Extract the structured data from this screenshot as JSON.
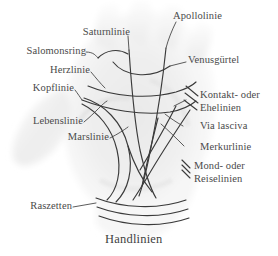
{
  "figure": {
    "title": "Handlinien",
    "caption": "Handlinien",
    "background_color": "#ffffff",
    "ink_color": "#3a3a3a",
    "label_color": "#4a4a4a"
  },
  "labels": {
    "apollolinie": "Apollolinie",
    "saturnlinie": "Saturnlinie",
    "venusguertel": "Venusgürtel",
    "salomonsring": "Salomonsring",
    "herzlinie": "Herzlinie",
    "kopflinie": "Kopflinie",
    "lebenslinie": "Lebenslinie",
    "marslinie": "Marslinie",
    "raszetten": "Raszetten",
    "kontakt_ehelinien_1": "Kontakt- oder",
    "kontakt_ehelinien_2": "Ehelinien",
    "via_lasciva": "Via lasciva",
    "merkurlinie": "Merkurlinie",
    "mond_reiselinien_1": "Mond- oder",
    "mond_reiselinien_2": "Reiselinien"
  },
  "line_features": [
    {
      "name": "Apollolinie",
      "side": "right"
    },
    {
      "name": "Saturnlinie",
      "side": "top"
    },
    {
      "name": "Venusgürtel",
      "side": "right"
    },
    {
      "name": "Salomonsring",
      "side": "left"
    },
    {
      "name": "Herzlinie",
      "side": "left"
    },
    {
      "name": "Kopflinie",
      "side": "left"
    },
    {
      "name": "Lebenslinie",
      "side": "left"
    },
    {
      "name": "Marslinie",
      "side": "left"
    },
    {
      "name": "Raszetten",
      "side": "left"
    },
    {
      "name": "Kontakt- oder Ehelinien",
      "side": "right"
    },
    {
      "name": "Via lasciva",
      "side": "right"
    },
    {
      "name": "Merkurlinie",
      "side": "right"
    },
    {
      "name": "Mond- oder Reiselinien",
      "side": "right"
    }
  ],
  "hatch_groups": {
    "ehelinien_count": 3,
    "reiselinien_count": 3,
    "raszetten_count": 3
  }
}
